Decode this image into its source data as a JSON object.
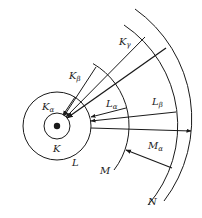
{
  "diagram": {
    "type": "atomic-shell-xray-transitions",
    "colors": {
      "line": "#1a1a1a",
      "background": "#ffffff"
    },
    "nucleus": {
      "cx": 57,
      "cy": 126
    },
    "shells": [
      {
        "name": "K",
        "label": "K",
        "radius": 13
      },
      {
        "name": "L",
        "label": "L",
        "radius": 34
      },
      {
        "name": "M",
        "label": "M",
        "radius": 72
      },
      {
        "name": "N",
        "label": "N",
        "radius": 121
      },
      {
        "name": "outer",
        "label": "",
        "radius": 135
      }
    ],
    "transitions": [
      {
        "label": "Kα",
        "main": "K",
        "sub": "α",
        "from": "L",
        "to": "K"
      },
      {
        "label": "Kβ",
        "main": "K",
        "sub": "β",
        "from": "M",
        "to": "K"
      },
      {
        "label": "Kγ",
        "main": "K",
        "sub": "γ",
        "from": "N",
        "to": "K"
      },
      {
        "label": "Lα",
        "main": "L",
        "sub": "α",
        "from": "M",
        "to": "L"
      },
      {
        "label": "Lβ",
        "main": "L",
        "sub": "β",
        "from": "N",
        "to": "L"
      },
      {
        "label": "Mα",
        "main": "M",
        "sub": "α",
        "from": "N",
        "to": "M"
      }
    ],
    "labels": {
      "K_alpha_main": "K",
      "K_alpha_sub": "α",
      "K_beta_main": "K",
      "K_beta_sub": "β",
      "K_gamma_main": "K",
      "K_gamma_sub": "γ",
      "L_alpha_main": "L",
      "L_alpha_sub": "α",
      "L_beta_main": "L",
      "L_beta_sub": "β",
      "M_alpha_main": "M",
      "M_alpha_sub": "α",
      "shell_K": "K",
      "shell_L": "L",
      "shell_M": "M",
      "shell_N": "N"
    }
  }
}
